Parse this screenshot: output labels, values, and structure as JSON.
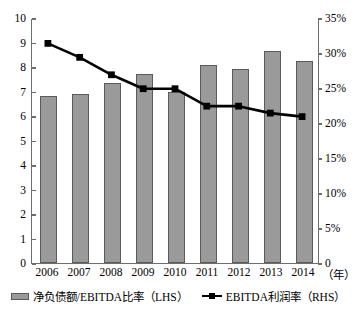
{
  "chart_data": {
    "type": "bar",
    "title": "",
    "subtitle": "",
    "xlabel": "（年）",
    "ylabel": "",
    "categories": [
      "2006",
      "2007",
      "2008",
      "2009",
      "2010",
      "2011",
      "2012",
      "2013",
      "2014"
    ],
    "grid": false,
    "legend_position": "bottom",
    "axes": {
      "left": {
        "min": 0,
        "max": 10,
        "step": 1,
        "ticks": [
          "0",
          "1",
          "2",
          "3",
          "4",
          "5",
          "6",
          "7",
          "8",
          "9",
          "10"
        ],
        "tick_values": [
          0,
          1,
          2,
          3,
          4,
          5,
          6,
          7,
          8,
          9,
          10
        ]
      },
      "right": {
        "min": 0,
        "max": 35,
        "step": 5,
        "ticks": [
          "0",
          "5%",
          "10%",
          "15%",
          "20%",
          "25%",
          "30%",
          "35%"
        ],
        "tick_values": [
          0,
          5,
          10,
          15,
          20,
          25,
          30,
          35
        ]
      }
    },
    "series": [
      {
        "name": "净负债额/EBITDA比率（LHS）",
        "short_name": "净负债额/EBITDA比率",
        "axis": "left",
        "render": "bar",
        "color": "#9a9a9a",
        "values": [
          6.8,
          6.9,
          7.35,
          7.7,
          7.0,
          8.1,
          7.9,
          8.65,
          8.25
        ]
      },
      {
        "name": "EBITDA利润率（RHS）",
        "short_name": "EBITDA利润率",
        "axis": "right",
        "render": "line",
        "color": "#000000",
        "values": [
          31.5,
          29.5,
          27.0,
          25.0,
          25.0,
          22.5,
          22.5,
          21.5,
          21.0
        ]
      }
    ]
  },
  "legend": {
    "items": [
      {
        "label": "净负债额/EBITDA比率（LHS）",
        "marker": "bar-swatch"
      },
      {
        "label": "EBITDA利润率（RHS）",
        "marker": "line-marker-swatch"
      }
    ]
  },
  "axis_unit_label": "（年）"
}
